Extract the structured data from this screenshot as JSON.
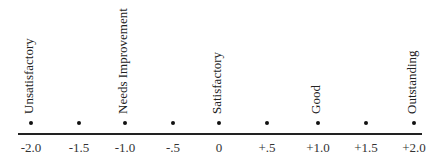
{
  "scale": {
    "ticks": [
      {
        "value": "-2.0",
        "x": 31
      },
      {
        "value": "-1.5",
        "x": 79
      },
      {
        "value": "-1.0",
        "x": 125
      },
      {
        "value": "-.5",
        "x": 173
      },
      {
        "value": "0",
        "x": 219
      },
      {
        "value": "+.5",
        "x": 267
      },
      {
        "value": "+1.0",
        "x": 318
      },
      {
        "value": "+1.5",
        "x": 366
      },
      {
        "value": "+2.0",
        "x": 414
      }
    ],
    "categories": [
      {
        "label": "Unsatisfactory",
        "x": 31
      },
      {
        "label": "Needs  Improvement",
        "x": 125
      },
      {
        "label": "Satisfactory",
        "x": 219
      },
      {
        "label": "Good",
        "x": 318
      },
      {
        "label": "Outstanding",
        "x": 414
      }
    ]
  }
}
